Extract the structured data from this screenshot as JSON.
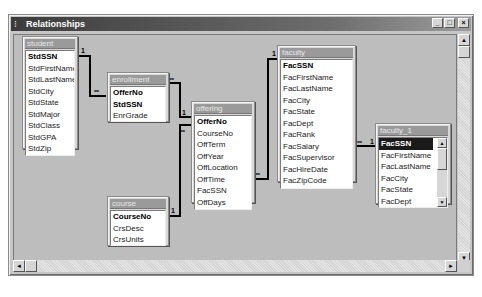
{
  "window": {
    "title": "Relationships",
    "controls": {
      "minimize": "_",
      "maximize": "□",
      "close": "×"
    }
  },
  "tables": [
    {
      "id": "student",
      "title": "student",
      "fields": [
        {
          "name": "StdSSN",
          "key": true
        },
        {
          "name": "StdFirstName"
        },
        {
          "name": "StdLastName"
        },
        {
          "name": "StdCity"
        },
        {
          "name": "StdState"
        },
        {
          "name": "StdMajor"
        },
        {
          "name": "StdClass"
        },
        {
          "name": "StdGPA"
        },
        {
          "name": "StdZip"
        }
      ]
    },
    {
      "id": "enrollment",
      "title": "enrollment",
      "fields": [
        {
          "name": "OfferNo",
          "key": true
        },
        {
          "name": "StdSSN",
          "key": true
        },
        {
          "name": "EnrGrade"
        }
      ]
    },
    {
      "id": "offering",
      "title": "offering",
      "fields": [
        {
          "name": "OfferNo",
          "key": true
        },
        {
          "name": "CourseNo"
        },
        {
          "name": "OffTerm"
        },
        {
          "name": "OffYear"
        },
        {
          "name": "OffLocation"
        },
        {
          "name": "OffTime"
        },
        {
          "name": "FacSSN"
        },
        {
          "name": "OffDays"
        }
      ]
    },
    {
      "id": "course",
      "title": "course",
      "fields": [
        {
          "name": "CourseNo",
          "key": true
        },
        {
          "name": "CrsDesc"
        },
        {
          "name": "CrsUnits"
        }
      ]
    },
    {
      "id": "faculty",
      "title": "faculty",
      "fields": [
        {
          "name": "FacSSN",
          "key": true
        },
        {
          "name": "FacFirstName"
        },
        {
          "name": "FacLastName"
        },
        {
          "name": "FacCity"
        },
        {
          "name": "FacState"
        },
        {
          "name": "FacDept"
        },
        {
          "name": "FacRank"
        },
        {
          "name": "FacSalary"
        },
        {
          "name": "FacSupervisor"
        },
        {
          "name": "FacHireDate"
        },
        {
          "name": "FacZipCode"
        }
      ]
    },
    {
      "id": "faculty_1",
      "title": "faculty_1",
      "fields": [
        {
          "name": "FacSSN",
          "key": true,
          "selected": true
        },
        {
          "name": "FacFirstName"
        },
        {
          "name": "FacLastName"
        },
        {
          "name": "FacCity"
        },
        {
          "name": "FacState"
        },
        {
          "name": "FacDept"
        }
      ]
    }
  ],
  "relationships": [
    {
      "from": "student.StdSSN",
      "to": "enrollment.StdSSN",
      "one": "1",
      "many": "∞"
    },
    {
      "from": "offering.OfferNo",
      "to": "enrollment.OfferNo",
      "one": "1",
      "many": "∞"
    },
    {
      "from": "course.CourseNo",
      "to": "offering.CourseNo",
      "one": "1",
      "many": "∞"
    },
    {
      "from": "faculty.FacSSN",
      "to": "offering.FacSSN",
      "one": "1",
      "many": "∞"
    },
    {
      "from": "faculty_1.FacSSN",
      "to": "faculty.FacSupervisor",
      "one": "1",
      "many": "∞"
    }
  ],
  "labels": {
    "one": "1",
    "many": "∞"
  },
  "scrollbars": {
    "up": "▲",
    "down": "▼",
    "left": "◄",
    "right": "►"
  }
}
